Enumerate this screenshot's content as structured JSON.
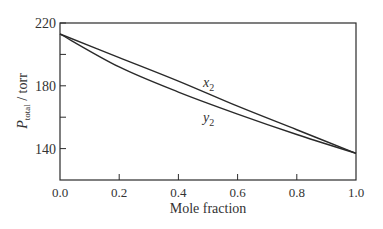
{
  "chart_data": {
    "type": "line",
    "title": "",
    "xlabel": "Mole fraction",
    "ylabel_main": "P",
    "ylabel_sub": "total",
    "ylabel_unit": " / torr",
    "xlim": [
      0,
      1
    ],
    "ylim": [
      120,
      220
    ],
    "xticks": [
      0.0,
      0.2,
      0.4,
      0.6,
      0.8,
      1.0
    ],
    "xtick_labels": [
      "0.0",
      "0.2",
      "0.4",
      "0.6",
      "0.8",
      "1.0"
    ],
    "yticks_labeled": [
      140,
      180,
      220
    ],
    "yticks_minor": [
      160,
      200
    ],
    "grid": false,
    "series": [
      {
        "name": "x2",
        "label_main": "x",
        "label_sub": "2",
        "x": [
          0.0,
          0.2,
          0.4,
          0.6,
          0.8,
          1.0
        ],
        "values": [
          213,
          198,
          183,
          167,
          152,
          137
        ]
      },
      {
        "name": "y2",
        "label_main": "y",
        "label_sub": "2",
        "x": [
          0.0,
          0.2,
          0.4,
          0.6,
          0.8,
          1.0
        ],
        "values": [
          213,
          192,
          176,
          162,
          149,
          137
        ]
      }
    ]
  }
}
